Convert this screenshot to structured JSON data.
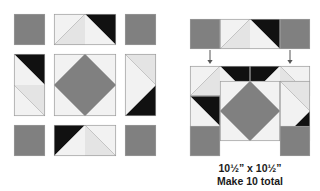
{
  "document": {
    "title": "Quilt Block Assembly Diagram",
    "background_color": "#ffffff"
  },
  "palette": {
    "medium_gray": "#808080",
    "dark_gray": "#6e6e6e",
    "light_gray": "#e4e4e4",
    "pale_gray": "#f2f2f2",
    "black": "#111111",
    "outline": "#9a9a9a",
    "seam_line": "#a8a8a8",
    "arrow": "#555555",
    "text": "#1a1a1a"
  },
  "caption": {
    "size_label": "10½” x 10½”",
    "quantity_label": "Make 10 total"
  },
  "arrows": {
    "name": "assembly-direction-arrow",
    "count": 2,
    "direction": "down",
    "positions": [
      {
        "x": 210,
        "y_top": 50,
        "y_bottom": 64
      },
      {
        "x": 290,
        "y_top": 50,
        "y_bottom": 64
      }
    ]
  },
  "units_panel": {
    "name": "component-units-grid",
    "rows": 3,
    "columns": 3,
    "cells": [
      {
        "name": "unit-corner-square-top-left",
        "kind": "plain-square",
        "fill": "medium_gray",
        "x": 14,
        "y": 14,
        "w": 31,
        "h": 31
      },
      {
        "name": "unit-flying-geese-top",
        "kind": "rect-double-hst-horizontal",
        "orientation": "black-right",
        "x": 54,
        "y": 14,
        "w": 62,
        "h": 31
      },
      {
        "name": "unit-corner-square-top-right",
        "kind": "plain-square",
        "fill": "medium_gray",
        "x": 125,
        "y": 14,
        "w": 31,
        "h": 31
      },
      {
        "name": "unit-flying-geese-left",
        "kind": "rect-double-hst-vertical",
        "orientation": "black-top",
        "x": 14,
        "y": 54,
        "w": 31,
        "h": 62
      },
      {
        "name": "unit-center-square-in-square",
        "kind": "square-in-square",
        "x": 54,
        "y": 54,
        "w": 62,
        "h": 62
      },
      {
        "name": "unit-flying-geese-right",
        "kind": "rect-double-hst-vertical",
        "orientation": "black-bottom",
        "x": 125,
        "y": 54,
        "w": 31,
        "h": 62
      },
      {
        "name": "unit-corner-square-bottom-left",
        "kind": "plain-square",
        "fill": "medium_gray",
        "x": 14,
        "y": 125,
        "w": 31,
        "h": 31
      },
      {
        "name": "unit-flying-geese-bottom",
        "kind": "rect-double-hst-horizontal",
        "orientation": "black-left",
        "x": 54,
        "y": 125,
        "w": 62,
        "h": 31
      },
      {
        "name": "unit-corner-square-bottom-right",
        "kind": "plain-square",
        "fill": "medium_gray",
        "x": 125,
        "y": 125,
        "w": 31,
        "h": 31
      }
    ]
  },
  "strip_panel": {
    "name": "assembled-top-row-strip",
    "x": 190,
    "y": 19,
    "w": 120,
    "h": 30,
    "cells": [
      {
        "name": "strip-square-left",
        "kind": "plain-square",
        "fill": "medium_gray",
        "x": 190,
        "y": 19,
        "w": 30,
        "h": 30
      },
      {
        "name": "strip-flying-geese",
        "kind": "rect-double-hst-horizontal",
        "orientation": "black-right",
        "x": 220,
        "y": 19,
        "w": 60,
        "h": 30
      },
      {
        "name": "strip-square-right",
        "kind": "plain-square",
        "fill": "medium_gray",
        "x": 280,
        "y": 19,
        "w": 30,
        "h": 30
      }
    ]
  },
  "block_panel": {
    "name": "assembled-finished-block",
    "x": 190,
    "y": 66,
    "w": 120,
    "h": 90,
    "cells": [
      {
        "name": "block-unit-top-left",
        "kind": "rect-double-hst-horizontal",
        "orientation": "black-right",
        "x": 190,
        "y": 66,
        "w": 60,
        "h": 30
      },
      {
        "name": "block-unit-top-right",
        "kind": "rect-double-hst-horizontal",
        "orientation": "black-left",
        "x": 250,
        "y": 66,
        "w": 60,
        "h": 30
      },
      {
        "name": "block-unit-middle-left",
        "kind": "rect-double-hst-vertical",
        "orientation": "black-top",
        "x": 190,
        "y": 96,
        "w": 30,
        "h": 60
      },
      {
        "name": "block-unit-center",
        "kind": "square-in-square",
        "x": 220,
        "y": 81,
        "w": 60,
        "h": 60
      },
      {
        "name": "block-unit-middle-right",
        "kind": "rect-double-hst-vertical",
        "orientation": "black-bottom",
        "x": 280,
        "y": 81,
        "w": 30,
        "h": 60
      },
      {
        "name": "block-unit-bottom-left",
        "kind": "plain-square",
        "fill": "medium_gray",
        "x": 190,
        "y": 126,
        "w": 30,
        "h": 30
      },
      {
        "name": "block-unit-bottom-right",
        "kind": "plain-square",
        "fill": "medium_gray",
        "x": 280,
        "y": 126,
        "w": 30,
        "h": 30
      }
    ]
  }
}
